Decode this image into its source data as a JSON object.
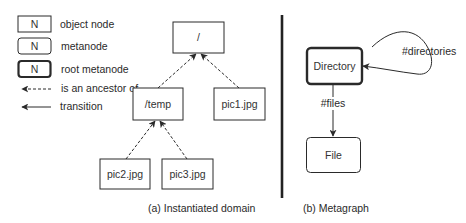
{
  "legend": {
    "items": [
      {
        "symbol": "N",
        "label": "object node",
        "style": "square-box"
      },
      {
        "symbol": "N",
        "label": "metanode",
        "style": "rounded-box"
      },
      {
        "symbol": "N",
        "label": "root metanode",
        "style": "rounded-box-bold"
      },
      {
        "symbol": "dashed-arrow",
        "label": "is an ancestor of"
      },
      {
        "symbol": "solid-arrow",
        "label": "transition"
      }
    ]
  },
  "instantiated_domain": {
    "caption": "(a) Instantiated domain",
    "nodes": [
      {
        "id": "root",
        "label": "/"
      },
      {
        "id": "temp",
        "label": "/temp"
      },
      {
        "id": "pic1",
        "label": "pic1.jpg"
      },
      {
        "id": "pic2",
        "label": "pic2.jpg"
      },
      {
        "id": "pic3",
        "label": "pic3.jpg"
      }
    ],
    "edges": [
      {
        "from": "temp",
        "to": "root",
        "type": "is an ancestor of"
      },
      {
        "from": "pic1",
        "to": "root",
        "type": "is an ancestor of"
      },
      {
        "from": "pic2",
        "to": "temp",
        "type": "is an ancestor of"
      },
      {
        "from": "pic3",
        "to": "temp",
        "type": "is an ancestor of"
      }
    ]
  },
  "metagraph": {
    "caption": "(b) Metagraph",
    "nodes": [
      {
        "id": "directory",
        "label": "Directory",
        "kind": "root metanode"
      },
      {
        "id": "file",
        "label": "File",
        "kind": "metanode"
      }
    ],
    "edges": [
      {
        "from": "directory",
        "to": "directory",
        "label": "#directories",
        "type": "transition"
      },
      {
        "from": "directory",
        "to": "file",
        "label": "#files",
        "type": "transition"
      }
    ]
  },
  "colors": {
    "stroke": "#2a2a2a",
    "divider": "#222222",
    "background": "#ffffff"
  }
}
